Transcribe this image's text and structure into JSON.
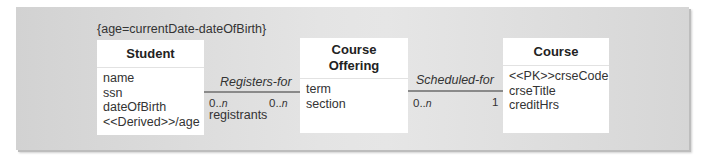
{
  "diagram": {
    "constraint": "{age=currentDate-dateOfBirth}",
    "classes": [
      {
        "name": "Student",
        "attributes": [
          "name",
          "ssn",
          "dateOfBirth",
          "<<Derived>>/age"
        ]
      },
      {
        "name_line1": "Course",
        "name_line2": "Offering",
        "attributes": [
          "term",
          "section"
        ]
      },
      {
        "name": "Course",
        "attributes": [
          "<<PK>>crseCode",
          "crseTitle",
          "creditHrs"
        ]
      }
    ],
    "associations": [
      {
        "name": "Registers-for",
        "left_mult_prefix": "0..",
        "left_mult_n": "n",
        "right_mult_prefix": "0..",
        "right_mult_n": "n",
        "role": "registrants"
      },
      {
        "name": "Scheduled-for",
        "left_mult_prefix": "0..",
        "left_mult_n": "n",
        "right_mult": "1"
      }
    ],
    "colors": {
      "panel": "#dcdcdc",
      "class_box": "#ffffff",
      "line": "#8a8a8a"
    }
  }
}
